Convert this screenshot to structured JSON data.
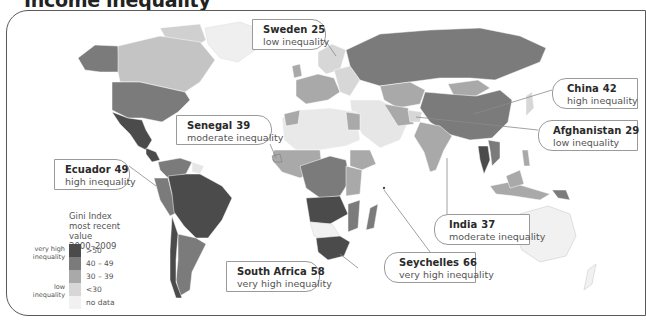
{
  "title": "Income inequality",
  "colors": {
    "very_high": "#4b4b4b",
    "high": "#7b7b7b",
    "moderate": "#a9a9a9",
    "low": "#d7d7d7",
    "no_data": "#f1f1f1",
    "frame": "#5a5a5a"
  },
  "legend": {
    "title_line1": "Gini Index",
    "title_line2": "most recent value",
    "title_line3": "2000–2009",
    "side_high": "very high inequality",
    "side_low": "low inequality",
    "items": [
      {
        "label": ">50",
        "class": "very_high"
      },
      {
        "label": "40 – 49",
        "class": "high"
      },
      {
        "label": "30 – 39",
        "class": "moderate"
      },
      {
        "label": "<30",
        "class": "low"
      },
      {
        "label": "no data",
        "class": "no_data"
      }
    ]
  },
  "callouts": [
    {
      "country": "Sweden",
      "value": "25",
      "desc": "low inequality"
    },
    {
      "country": "China",
      "value": "42",
      "desc": "high inequality"
    },
    {
      "country": "Afghanistan",
      "value": "29",
      "desc": "low inequality"
    },
    {
      "country": "Senegal",
      "value": "39",
      "desc": "moderate inequality"
    },
    {
      "country": "Ecuador",
      "value": "49",
      "desc": "high inequality"
    },
    {
      "country": "India",
      "value": "37",
      "desc": "moderate inequality"
    },
    {
      "country": "Seychelles",
      "value": "66",
      "desc": "very high inequality"
    },
    {
      "country": "South Africa",
      "value": "58",
      "desc": "very high inequality"
    }
  ]
}
